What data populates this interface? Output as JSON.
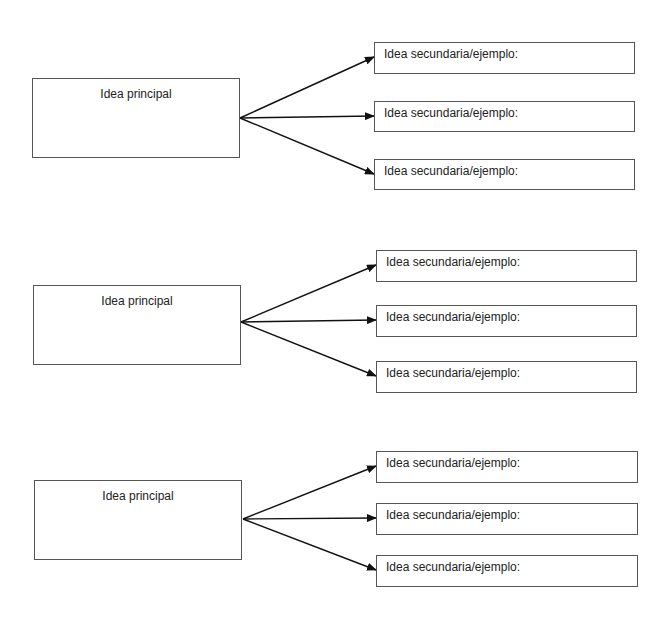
{
  "diagram": {
    "groups": [
      {
        "main": {
          "label": "Idea principal",
          "x": 32,
          "y": 78,
          "w": 208,
          "h": 80
        },
        "origin": [
          240,
          118
        ],
        "secondary": [
          {
            "label": "Idea secundaria/ejemplo:",
            "x": 374,
            "y": 42,
            "w": 261,
            "h": 32
          },
          {
            "label": "Idea secundaria/ejemplo:",
            "x": 374,
            "y": 101,
            "w": 261,
            "h": 31
          },
          {
            "label": "Idea secundaria/ejemplo:",
            "x": 374,
            "y": 159,
            "w": 261,
            "h": 31
          }
        ]
      },
      {
        "main": {
          "label": "Idea principal",
          "x": 33,
          "y": 285,
          "w": 208,
          "h": 80
        },
        "origin": [
          241,
          322
        ],
        "secondary": [
          {
            "label": "Idea secundaria/ejemplo:",
            "x": 376,
            "y": 250,
            "w": 261,
            "h": 32
          },
          {
            "label": "Idea secundaria/ejemplo:",
            "x": 376,
            "y": 305,
            "w": 261,
            "h": 32
          },
          {
            "label": "Idea secundaria/ejemplo:",
            "x": 376,
            "y": 361,
            "w": 261,
            "h": 32
          }
        ]
      },
      {
        "main": {
          "label": "Idea principal",
          "x": 34,
          "y": 480,
          "w": 208,
          "h": 80
        },
        "origin": [
          243,
          519
        ],
        "secondary": [
          {
            "label": "Idea secundaria/ejemplo:",
            "x": 376,
            "y": 451,
            "w": 262,
            "h": 32
          },
          {
            "label": "Idea secundaria/ejemplo:",
            "x": 376,
            "y": 503,
            "w": 262,
            "h": 32
          },
          {
            "label": "Idea secundaria/ejemplo:",
            "x": 376,
            "y": 555,
            "w": 262,
            "h": 32
          }
        ]
      }
    ]
  }
}
